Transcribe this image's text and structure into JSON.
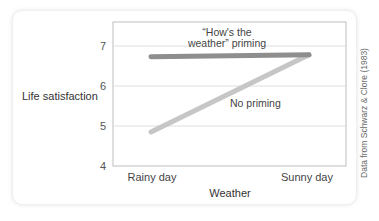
{
  "chart_data": {
    "type": "line",
    "title": "",
    "xlabel": "Weather",
    "ylabel": "Life satisfaction",
    "categories": [
      "Rainy day",
      "Sunny day"
    ],
    "ylim": [
      4,
      7.5
    ],
    "yticks": [
      4,
      5,
      6,
      7
    ],
    "grid": true,
    "legend_position": "inline labels",
    "series": [
      {
        "name": "“How's the weather” priming",
        "label_lines": [
          "“How's the",
          "weather” priming"
        ],
        "values": [
          6.73,
          6.78
        ],
        "color": "#8e8e8e"
      },
      {
        "name": "No priming",
        "label_lines": [
          "No priming"
        ],
        "values": [
          4.85,
          6.78
        ],
        "color": "#c6c6c6"
      }
    ],
    "source_note": "Data from Schwarz & Clore (1983)"
  }
}
